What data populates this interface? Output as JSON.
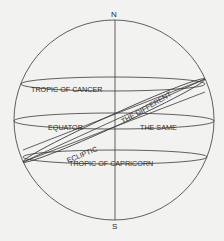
{
  "diagram": {
    "poles": {
      "north": "N",
      "south": "S"
    },
    "labels": {
      "tropic_of_cancer": "TROPIC OF CANCER",
      "equator": "EQUATOR",
      "ecliptic": "ECLIPTIC",
      "the_different": "THE DIFFERENT",
      "the_same": "THE SAME",
      "tropic_of_capricorn": "TROPIC OF  CAPRICORN"
    },
    "colors": {
      "background": "#f2f2f0",
      "line": "#3a3a3a",
      "text": "#2a2a2a"
    }
  }
}
